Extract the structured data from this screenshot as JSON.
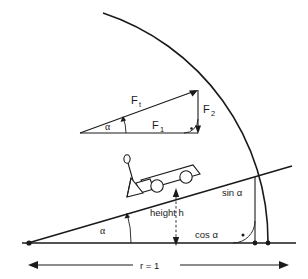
{
  "diagram": {
    "type": "physics-diagram",
    "stroke_color": "#1a1a1a",
    "background_color": "#ffffff",
    "labels": {
      "force_hypotenuse": "F",
      "force_hypotenuse_sub": "t",
      "force_vertical": "F",
      "force_vertical_sub": "2",
      "force_horizontal": "F",
      "force_horizontal_sub": "1",
      "angle_triangle": "α",
      "angle_incline": "α",
      "height": "height h",
      "sine": "sin α",
      "cosine": "cos α",
      "radius": "r = 1"
    },
    "geometry": {
      "origin_x": 28,
      "origin_y": 243,
      "baseline_end_x": 292,
      "incline_end_x": 290,
      "incline_end_y": 167,
      "arc_radius": 240,
      "vertical_drop_x": 255,
      "arc_end_x": 268,
      "angle_alpha_degrees": 16
    },
    "markers": {
      "right_angle_symbol": "⊥",
      "vertex_dot": "•"
    }
  }
}
